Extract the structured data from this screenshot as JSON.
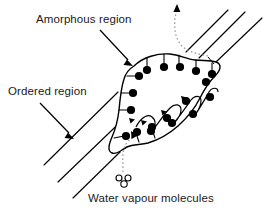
{
  "figure": {
    "type": "diagram",
    "width": 270,
    "height": 218,
    "background_color": "#ffffff",
    "line_color": "#000000",
    "dot_color": "#000000",
    "dashed_color": "#9a9a9a",
    "text_color": "#1a1a1a"
  },
  "labels": {
    "amorphous": "Amorphous region",
    "ordered": "Ordered region",
    "water": "Water vapour molecules"
  },
  "icons": {
    "amorphous_pointer": "arrow-down-right-icon",
    "ordered_pointer": "arrow-down-right-icon",
    "water_molecule": "water-molecule-icon",
    "vapour_in": "dashed-curved-arrow-in-icon",
    "vapour_out": "dashed-curved-arrow-out-icon"
  },
  "elements": {
    "ordered_region_lines_lower": 3,
    "ordered_region_lines_upper": 3,
    "amorphous_blob": "closed-irregular-outline",
    "bound_water_dots": 18,
    "interior_chain_arches": 5
  }
}
